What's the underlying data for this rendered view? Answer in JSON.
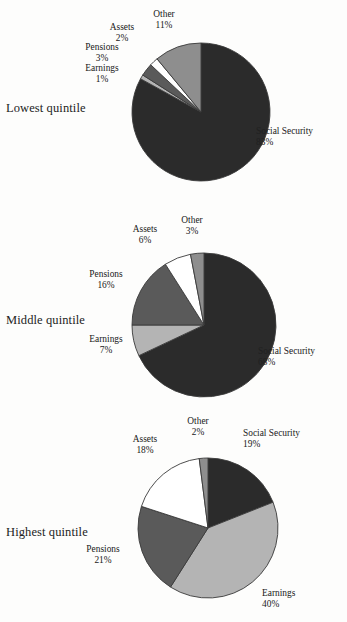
{
  "chart_data": [
    {
      "type": "pie",
      "title": "Lowest quintile",
      "categories": [
        "Social Security",
        "Earnings",
        "Pensions",
        "Assets",
        "Other"
      ],
      "values": [
        83,
        1,
        3,
        2,
        11
      ],
      "value_labels": [
        "83%",
        "1%",
        "3%",
        "2%",
        "11%"
      ],
      "colors": [
        "#2b2b2b",
        "#b4b4b4",
        "#5a5a5a",
        "#ffffff",
        "#8e8e8e"
      ],
      "start_angle": 0,
      "direction": "clockwise",
      "legend": "none",
      "grid": false
    },
    {
      "type": "pie",
      "title": "Middle quintile",
      "categories": [
        "Social Security",
        "Earnings",
        "Pensions",
        "Assets",
        "Other"
      ],
      "values": [
        68,
        7,
        16,
        6,
        3
      ],
      "value_labels": [
        "68%",
        "7%",
        "16%",
        "6%",
        "3%"
      ],
      "colors": [
        "#2b2b2b",
        "#b4b4b4",
        "#5a5a5a",
        "#ffffff",
        "#8e8e8e"
      ],
      "start_angle": 0,
      "direction": "clockwise",
      "legend": "none",
      "grid": false
    },
    {
      "type": "pie",
      "title": "Highest quintile",
      "categories": [
        "Social Security",
        "Earnings",
        "Pensions",
        "Assets",
        "Other"
      ],
      "values": [
        19,
        40,
        21,
        18,
        2
      ],
      "value_labels": [
        "19%",
        "40%",
        "21%",
        "18%",
        "2%"
      ],
      "colors": [
        "#2b2b2b",
        "#b4b4b4",
        "#5a5a5a",
        "#ffffff",
        "#8e8e8e"
      ],
      "start_angle": 0,
      "direction": "clockwise",
      "legend": "none",
      "grid": false
    }
  ],
  "panels": [
    {
      "quintile": "Lowest quintile",
      "pie": {
        "cx": 201,
        "cy": 112,
        "r": 69
      },
      "labels": [
        {
          "name": "Social Security",
          "pct": "83%",
          "x": 256,
          "y": 126,
          "align": "left"
        },
        {
          "name": "Other",
          "pct": "11%",
          "x": 132,
          "y": 9,
          "align": "center"
        },
        {
          "name": "Assets",
          "pct": "2%",
          "x": 90,
          "y": 22,
          "align": "center"
        },
        {
          "name": "Pensions",
          "pct": "3%",
          "x": 70,
          "y": 42,
          "align": "center"
        },
        {
          "name": "Earnings",
          "pct": "1%",
          "x": 70,
          "y": 63,
          "align": "center"
        }
      ]
    },
    {
      "quintile": "Middle quintile",
      "pie": {
        "cx": 204,
        "cy": 117,
        "r": 72
      },
      "labels": [
        {
          "name": "Social Security",
          "pct": "68%",
          "x": 258,
          "y": 138,
          "align": "left"
        },
        {
          "name": "Other",
          "pct": "3%",
          "x": 160,
          "y": 7,
          "align": "center"
        },
        {
          "name": "Assets",
          "pct": "6%",
          "x": 113,
          "y": 16,
          "align": "center"
        },
        {
          "name": "Pensions",
          "pct": "16%",
          "x": 74,
          "y": 61,
          "align": "center"
        },
        {
          "name": "Earnings",
          "pct": "7%",
          "x": 74,
          "y": 126,
          "align": "center"
        }
      ]
    },
    {
      "quintile": "Highest quintile",
      "pie": {
        "cx": 208,
        "cy": 113,
        "r": 70
      },
      "labels": [
        {
          "name": "Social Security",
          "pct": "19%",
          "x": 243,
          "y": 13,
          "align": "left"
        },
        {
          "name": "Other",
          "pct": "2%",
          "x": 166,
          "y": 1,
          "align": "center"
        },
        {
          "name": "Assets",
          "pct": "18%",
          "x": 113,
          "y": 19,
          "align": "center"
        },
        {
          "name": "Pensions",
          "pct": "21%",
          "x": 71,
          "y": 129,
          "align": "center"
        },
        {
          "name": "Earnings",
          "pct": "40%",
          "x": 262,
          "y": 173,
          "align": "left"
        }
      ]
    }
  ]
}
